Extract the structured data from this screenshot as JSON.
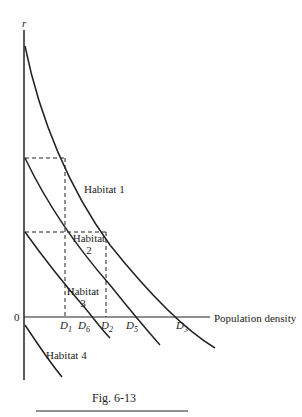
{
  "figure": {
    "caption": "Fig. 6-13",
    "y_axis_label": "r",
    "x_axis_label": "Population density",
    "origin_label": "0",
    "curves": [
      {
        "name": "Habitat 1",
        "line1": "Habitat 1",
        "line2": ""
      },
      {
        "name": "Habitat 2",
        "line1": "Habitat",
        "line2": "2"
      },
      {
        "name": "Habitat 3",
        "line1": "Habitat",
        "line2": "3"
      },
      {
        "name": "Habitat 4",
        "line1": "Habitat 4",
        "line2": ""
      }
    ],
    "x_ticks": [
      {
        "base": "D",
        "sub": "1"
      },
      {
        "base": "D",
        "sub": "6"
      },
      {
        "base": "D",
        "sub": "2"
      },
      {
        "base": "D",
        "sub": "5"
      },
      {
        "base": "D",
        "sub": "3"
      }
    ]
  }
}
